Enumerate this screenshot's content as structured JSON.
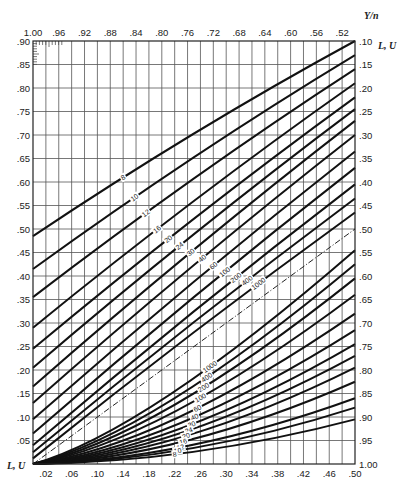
{
  "chart_data": {
    "type": "line",
    "title": "",
    "top_axis": {
      "label": "Y/n",
      "ticks": [
        "1.00",
        ".96",
        ".92",
        ".88",
        ".84",
        ".80",
        ".76",
        ".72",
        ".68",
        ".64",
        ".60",
        ".56",
        ".52"
      ],
      "range": [
        1.0,
        0.5
      ]
    },
    "bottom_axis": {
      "label": "Y/n",
      "ticks": [
        ".02",
        ".06",
        ".10",
        ".14",
        ".18",
        ".22",
        ".26",
        ".30",
        ".34",
        ".38",
        ".42",
        ".46",
        ".50"
      ],
      "range": [
        0.0,
        0.5
      ]
    },
    "left_axis": {
      "label": "L, U",
      "ticks": [
        ".05",
        ".10",
        ".15",
        ".20",
        ".25",
        ".30",
        ".35",
        ".40",
        ".45",
        ".50",
        ".55",
        ".60",
        ".65",
        ".70",
        ".75",
        ".80",
        ".85",
        ".90"
      ],
      "range": [
        0.0,
        0.9
      ]
    },
    "right_axis": {
      "label": "L, U",
      "ticks": [
        ".10",
        ".15",
        ".20",
        ".25",
        ".30",
        ".35",
        ".40",
        ".45",
        ".50",
        ".55",
        ".60",
        ".65",
        ".70",
        ".75",
        ".80",
        ".85",
        ".90",
        ".95",
        "1.00"
      ],
      "range": [
        0.1,
        1.0
      ]
    },
    "grid": true,
    "upper_family": {
      "description": "Curves from left axis rising to right axis",
      "series": [
        {
          "name": "8",
          "start_y": 0.485,
          "end_y": 0.1
        },
        {
          "name": "10",
          "start_y": 0.415,
          "end_y": 0.13
        },
        {
          "name": "12",
          "start_y": 0.355,
          "end_y": 0.16
        },
        {
          "name": "16",
          "start_y": 0.29,
          "end_y": 0.19
        },
        {
          "name": "20",
          "start_y": 0.245,
          "end_y": 0.22
        },
        {
          "name": "24",
          "start_y": 0.205,
          "end_y": 0.245
        },
        {
          "name": "30",
          "start_y": 0.165,
          "end_y": 0.27
        },
        {
          "name": "40",
          "start_y": 0.13,
          "end_y": 0.3
        },
        {
          "name": "60",
          "start_y": 0.095,
          "end_y": 0.335
        },
        {
          "name": "100",
          "start_y": 0.065,
          "end_y": 0.37
        },
        {
          "name": "200",
          "start_y": 0.04,
          "end_y": 0.405
        },
        {
          "name": "400",
          "start_y": 0.025,
          "end_y": 0.435
        },
        {
          "name": "1000",
          "start_y": 0.012,
          "end_y": 0.465
        }
      ],
      "labels": [
        "8",
        "10",
        "12",
        "16",
        "20",
        "24",
        "30",
        "40",
        "60",
        "100",
        "200",
        "400",
        "1000"
      ]
    },
    "diagonal": {
      "description": "dash-dot line from origin to Y/n=.50, L,U=.50 (right .50)",
      "style": "dash-dot"
    },
    "lower_family": {
      "description": "Curves from origin fanning to right axis",
      "series": [
        {
          "name": "1000",
          "end_right": 0.545
        },
        {
          "name": "400",
          "end_right": 0.575
        },
        {
          "name": "200",
          "end_right": 0.605
        },
        {
          "name": "100",
          "end_right": 0.64
        },
        {
          "name": "60",
          "end_right": 0.68
        },
        {
          "name": "40",
          "end_right": 0.715
        },
        {
          "name": "30",
          "end_right": 0.745
        },
        {
          "name": "24",
          "end_right": 0.77
        },
        {
          "name": "20",
          "end_right": 0.795
        },
        {
          "name": "16",
          "end_right": 0.825
        },
        {
          "name": "12",
          "end_right": 0.86
        },
        {
          "name": "10",
          "end_right": 0.88
        },
        {
          "name": "8",
          "end_right": 0.905
        }
      ],
      "labels": [
        "1000",
        "400",
        "200",
        "100",
        "60",
        "40",
        "30",
        "24",
        "20",
        "16",
        "12",
        "10",
        "8"
      ]
    }
  }
}
